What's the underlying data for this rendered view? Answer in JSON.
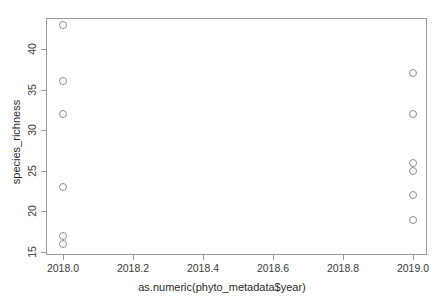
{
  "chart_data": {
    "type": "scatter",
    "title": "",
    "xlabel": "as.numeric(phyto_metadata$year)",
    "ylabel": "species_richness",
    "xlim": [
      2017.97,
      2019.03
    ],
    "ylim": [
      14.5,
      43.9
    ],
    "grid": false,
    "legend": null,
    "xticks": [
      2018.0,
      2018.2,
      2018.4,
      2018.6,
      2018.8,
      2019.0
    ],
    "xtick_labels": [
      "2018.0",
      "2018.2",
      "2018.4",
      "2018.6",
      "2018.8",
      "2019.0"
    ],
    "yticks": [
      15,
      20,
      25,
      30,
      35,
      40
    ],
    "ytick_labels": [
      "15",
      "20",
      "25",
      "30",
      "35",
      "40"
    ],
    "marker": "open-circle",
    "marker_color": "#8d8d8d",
    "frame_color": "#9a9a9a",
    "points": [
      {
        "x": 2018.0,
        "y": 43
      },
      {
        "x": 2018.0,
        "y": 36
      },
      {
        "x": 2018.0,
        "y": 32
      },
      {
        "x": 2018.0,
        "y": 23
      },
      {
        "x": 2018.0,
        "y": 17
      },
      {
        "x": 2018.0,
        "y": 16
      },
      {
        "x": 2019.0,
        "y": 37
      },
      {
        "x": 2019.0,
        "y": 32
      },
      {
        "x": 2019.0,
        "y": 26
      },
      {
        "x": 2019.0,
        "y": 25
      },
      {
        "x": 2019.0,
        "y": 22
      },
      {
        "x": 2019.0,
        "y": 19
      }
    ],
    "series": [
      {
        "name": "species_richness",
        "x": [
          2018.0,
          2018.0,
          2018.0,
          2018.0,
          2018.0,
          2018.0,
          2019.0,
          2019.0,
          2019.0,
          2019.0,
          2019.0,
          2019.0
        ],
        "values": [
          43,
          36,
          32,
          23,
          17,
          16,
          37,
          32,
          26,
          25,
          22,
          19
        ]
      }
    ]
  }
}
